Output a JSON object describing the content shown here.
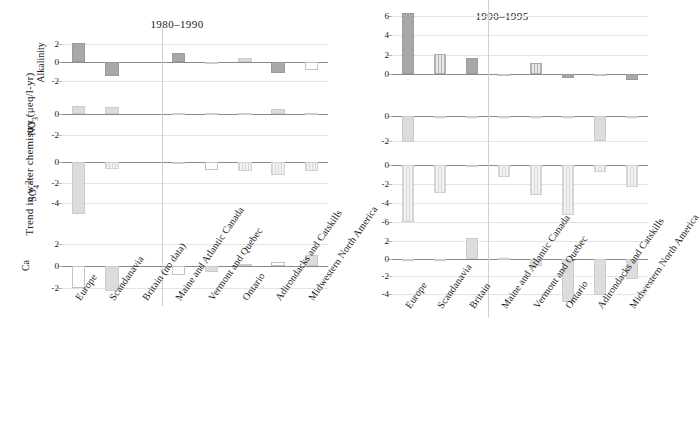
{
  "figure": {
    "ylabel": "Trend in water chemistry (μeq/l-yr)"
  },
  "chart_data": [
    {
      "type": "bar",
      "title": "1980–1990",
      "xlabel": "",
      "ylabel": "Trend in water chemistry (μeq/l-yr)",
      "grid": true,
      "legend": "none",
      "categories": [
        "Europe",
        "Scandanavia",
        "Britain (no data)",
        "Maine and Atlantic Canada",
        "Vermont and Quebec",
        "Ontario",
        "Adirondacks and Catskills",
        "Midwestern North America"
      ],
      "panels": [
        {
          "name": "Alkalinity",
          "ylim": [
            -3,
            2.6
          ],
          "ticks": [
            2,
            0,
            -2
          ],
          "values": [
            2.1,
            -1.5,
            0,
            1.0,
            0.05,
            0.5,
            -1.2,
            -0.8
          ],
          "styles": [
            "solid",
            "solid",
            "open",
            "solid",
            "light",
            "light",
            "solid",
            "open"
          ]
        },
        {
          "name": "NO3-",
          "ylim": [
            -3,
            1.3
          ],
          "ticks": [
            0,
            -2
          ],
          "values": [
            0.7,
            0.6,
            0,
            0.08,
            0.05,
            0.06,
            0.5,
            0.07
          ],
          "styles": [
            "light",
            "light",
            "open",
            "light",
            "light",
            "light",
            "light",
            "light"
          ]
        },
        {
          "name": "SO42-",
          "ylim": [
            -5.6,
            0.6
          ],
          "ticks": [
            0,
            -2,
            -4
          ],
          "values": [
            -5.0,
            -0.7,
            0,
            -0.08,
            -0.8,
            -0.9,
            -1.2,
            -0.9
          ],
          "styles": [
            "light",
            "lighthatch",
            "open",
            "light",
            "open",
            "lighthatch",
            "lighthatch",
            "lighthatch"
          ]
        },
        {
          "name": "Ca",
          "ylim": [
            -2.6,
            2.4
          ],
          "ticks": [
            2,
            0,
            -2
          ],
          "values": [
            -2.0,
            -2.3,
            0,
            -0.8,
            -0.6,
            0.15,
            0.4,
            1.0
          ],
          "styles": [
            "open",
            "light",
            "open",
            "open",
            "light",
            "light",
            "open",
            "light"
          ]
        }
      ]
    },
    {
      "type": "bar",
      "title": "1990–1995",
      "xlabel": "",
      "ylabel": "Trend in water chemistry (μeq/l-yr)",
      "grid": true,
      "legend": "none",
      "categories": [
        "Europe",
        "Scandanavia",
        "Britain",
        "Maine and Atlantic Canada",
        "Vermont and Quebec",
        "Ontario",
        "Adirondacks and Catskills",
        "Midwestern North America"
      ],
      "panels": [
        {
          "name": "Alkalinity",
          "ylim": [
            -1.2,
            6.8
          ],
          "ticks": [
            6,
            4,
            2,
            0
          ],
          "values": [
            6.3,
            2.1,
            1.7,
            -0.05,
            1.2,
            -0.4,
            0.05,
            -0.6
          ],
          "styles": [
            "solid",
            "hatch",
            "solid",
            "open",
            "hatch",
            "solid",
            "open",
            "solid"
          ]
        },
        {
          "name": "NO3-",
          "ylim": [
            -2.6,
            0.6
          ],
          "ticks": [
            0,
            -2
          ],
          "values": [
            -2.1,
            -0.05,
            -0.05,
            -0.05,
            -0.05,
            -0.05,
            -2.0,
            -0.05
          ],
          "styles": [
            "light",
            "light",
            "light",
            "light",
            "light",
            "light",
            "light",
            "light"
          ]
        },
        {
          "name": "SO42-",
          "ylim": [
            -6.4,
            0.5
          ],
          "ticks": [
            0,
            -2,
            -4,
            -6
          ],
          "values": [
            -6.0,
            -3.0,
            -0.05,
            -1.3,
            -3.2,
            -5.3,
            -0.8,
            -2.3
          ],
          "styles": [
            "lighthatch",
            "lighthatch",
            "light",
            "lighthatch",
            "lighthatch",
            "lighthatch",
            "lighthatch",
            "lighthatch"
          ]
        },
        {
          "name": "Ca",
          "ylim": [
            -5.4,
            2.8
          ],
          "ticks": [
            2,
            0,
            -2,
            -4
          ],
          "values": [
            -0.1,
            -0.05,
            2.3,
            0.03,
            -0.9,
            -5.0,
            -4.1,
            -2.3
          ],
          "styles": [
            "light",
            "light",
            "light",
            "light",
            "light",
            "light",
            "light",
            "light"
          ]
        }
      ]
    }
  ]
}
